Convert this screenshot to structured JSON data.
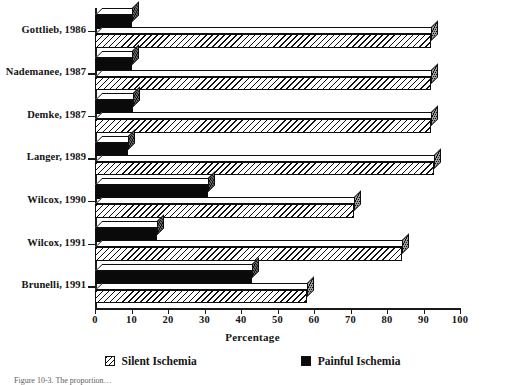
{
  "chart_data": {
    "type": "bar",
    "orientation": "horizontal",
    "title": "",
    "xlabel": "Percentage",
    "ylabel": "",
    "xlim": [
      0,
      100
    ],
    "xticks": [
      0,
      10,
      20,
      30,
      40,
      50,
      60,
      70,
      80,
      90,
      100
    ],
    "grid": false,
    "legend_position": "bottom",
    "categories": [
      "Gottlieb, 1986",
      "Nademanee, 1987",
      "Demke, 1987",
      "Langer, 1989",
      "Wilcox, 1990",
      "Wilcox, 1991",
      "Brunelli, 1991"
    ],
    "series": [
      {
        "name": "Silent Ischemia",
        "pattern": "diagonal-hatch",
        "values": [
          92,
          92,
          92,
          93,
          71,
          84,
          58
        ]
      },
      {
        "name": "Painful Ischemia",
        "pattern": "solid-black",
        "values": [
          10,
          10,
          10.5,
          9,
          31,
          17,
          43
        ]
      }
    ]
  },
  "axis": {
    "x_label": "Percentage",
    "tick_labels": [
      "0",
      "10",
      "20",
      "30",
      "40",
      "50",
      "60",
      "70",
      "80",
      "90",
      "100"
    ]
  },
  "legend": {
    "items": [
      {
        "label": "Silent Ischemia",
        "swatch": "hatched-square-icon"
      },
      {
        "label": "Painful Ischemia",
        "swatch": "filled-square-icon"
      }
    ]
  },
  "caption": {
    "text": "Figure 10-3.  The proportion…"
  }
}
